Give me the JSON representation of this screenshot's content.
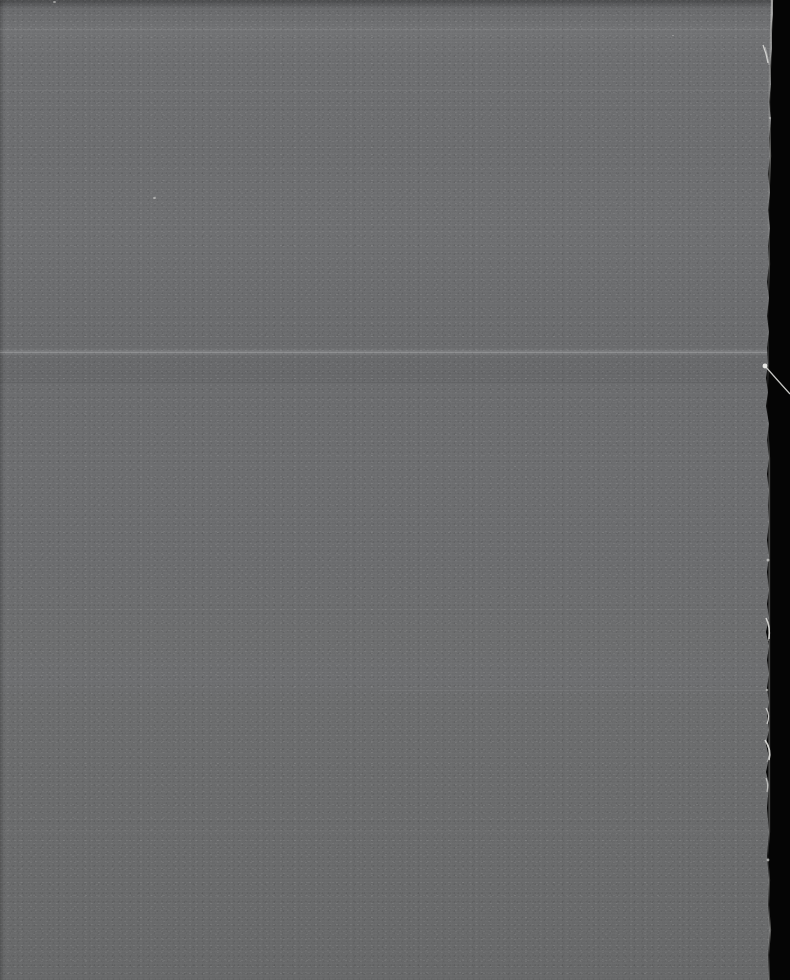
{
  "image": {
    "kind": "natural-image",
    "subject": "blank-gray-field-scan",
    "description": "Nearly featureless underexposed gray photographic scan with a torn paper edge at the right against a black background",
    "width": 790,
    "height": 980,
    "caption": "Blank gray scan with torn right edge"
  },
  "colors": {
    "backdrop_black": "#050505",
    "paper_gray_light": "#737476",
    "paper_gray_mid": "#6e6f71",
    "paper_gray_dark": "#696a6b",
    "top_band": "#5f6062",
    "streak_highlight": "#7c7d7f",
    "fiber_white": "#e8e8e6"
  },
  "regions": {
    "paper_field": {
      "label": "Gray field",
      "left": 0,
      "top": 0,
      "width": 775,
      "height": 980
    },
    "black_margin": {
      "label": "Black margin",
      "left": 766,
      "top": 0,
      "width": 24,
      "height": 980
    }
  },
  "features": {
    "horizontal_lines": [
      {
        "name": "top-rule",
        "y": 29,
        "left": 0,
        "width": 775,
        "color": "rgba(255,255,255,0.10)"
      },
      {
        "name": "upper-rule",
        "y": 90,
        "left": 0,
        "width": 775,
        "color": "rgba(255,255,255,0.045)"
      },
      {
        "name": "bright-streak",
        "y": 352,
        "left": 0,
        "width": 775,
        "color": "rgba(255,255,255,0.17)"
      },
      {
        "name": "tone-step",
        "y": 382,
        "left": 0,
        "width": 775,
        "color": "rgba(0,0,0,0.07)"
      },
      {
        "name": "mid-rule",
        "y": 690,
        "left": 380,
        "width": 395,
        "color": "rgba(255,255,255,0.05)"
      },
      {
        "name": "lower-rule",
        "y": 830,
        "left": 0,
        "width": 775,
        "color": "rgba(255,255,255,0.035)"
      }
    ],
    "dust_specks": [
      {
        "name": "speck-top-left",
        "x": 53,
        "y": 1,
        "size": 3,
        "color": "rgba(225,225,222,0.55)"
      },
      {
        "name": "speck-mid-left",
        "x": 153,
        "y": 197,
        "size": 3,
        "color": "rgba(225,225,222,0.60)"
      },
      {
        "name": "speck-upper-right",
        "x": 672,
        "y": 35,
        "size": 2,
        "color": "rgba(215,215,212,0.40)"
      }
    ],
    "edge_fibers": [
      {
        "name": "fiber-top",
        "y": 52,
        "length": 22
      },
      {
        "name": "fiber-hair",
        "y": 372,
        "length": 36
      },
      {
        "name": "fiber-mid-a",
        "y": 625,
        "length": 18
      },
      {
        "name": "fiber-mid-b",
        "y": 715,
        "length": 14
      },
      {
        "name": "fiber-mid-c",
        "y": 748,
        "length": 20
      },
      {
        "name": "fiber-low",
        "y": 782,
        "length": 12
      }
    ]
  }
}
